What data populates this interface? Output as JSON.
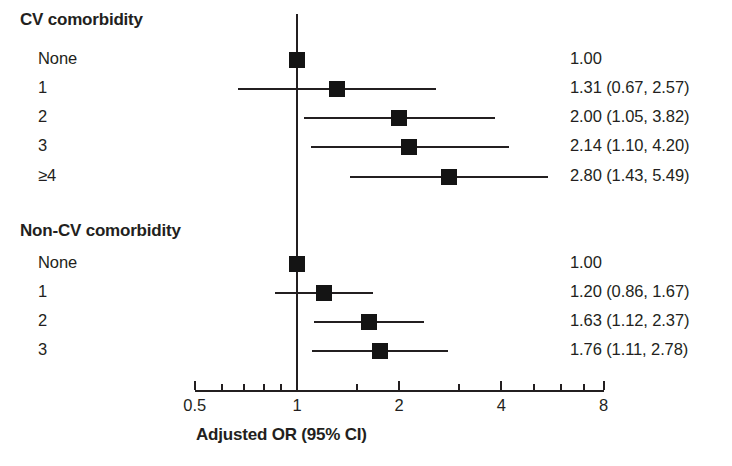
{
  "chart_data": {
    "type": "table",
    "title": "",
    "xlabel": "Adjusted OR (95% CI)",
    "ylabel": "",
    "scale": "log2",
    "xlim": [
      0.5,
      8
    ],
    "reference_line": 1.0,
    "grid": false,
    "legend": "none",
    "axis": {
      "caption": "Adjusted OR (95% CI)",
      "major_ticks": [
        {
          "value": 0.5,
          "label": "0.5"
        },
        {
          "value": 1,
          "label": "1"
        },
        {
          "value": 2,
          "label": "2"
        },
        {
          "value": 4,
          "label": "4"
        },
        {
          "value": 8,
          "label": "8"
        }
      ],
      "minor_ticks": [
        0.6,
        0.7,
        0.8,
        0.9,
        1.5,
        3,
        5,
        6,
        7
      ]
    },
    "groups": [
      {
        "header": "CV comorbidity",
        "rows": [
          {
            "label": "None",
            "or": 1.0,
            "lcl": null,
            "ucl": null,
            "text": "1.00"
          },
          {
            "label": "1",
            "or": 1.31,
            "lcl": 0.67,
            "ucl": 2.57,
            "text": "1.31 (0.67, 2.57)"
          },
          {
            "label": "2",
            "or": 2.0,
            "lcl": 1.05,
            "ucl": 3.82,
            "text": "2.00 (1.05, 3.82)"
          },
          {
            "label": "3",
            "or": 2.14,
            "lcl": 1.1,
            "ucl": 4.2,
            "text": "2.14 (1.10, 4.20)"
          },
          {
            "label": "≥4",
            "or": 2.8,
            "lcl": 1.43,
            "ucl": 5.49,
            "text": "2.80 (1.43, 5.49)"
          }
        ]
      },
      {
        "header": "Non-CV comorbidity",
        "rows": [
          {
            "label": "None",
            "or": 1.0,
            "lcl": null,
            "ucl": null,
            "text": "1.00"
          },
          {
            "label": "1",
            "or": 1.2,
            "lcl": 0.86,
            "ucl": 1.67,
            "text": "1.20 (0.86, 1.67)"
          },
          {
            "label": "2",
            "or": 1.63,
            "lcl": 1.12,
            "ucl": 2.37,
            "text": "1.63 (1.12, 2.37)"
          },
          {
            "label": "3",
            "or": 1.76,
            "lcl": 1.11,
            "ucl": 2.78,
            "text": "1.76 (1.11, 2.78)"
          }
        ]
      }
    ],
    "colors": {
      "marker": "#141414",
      "line": "#231f20",
      "text": "#231f20"
    }
  },
  "layout": {
    "label_x": 38,
    "header_x": 20,
    "stat_x": 570,
    "row_y": [
      60,
      89,
      118,
      147,
      177,
      264,
      293,
      322,
      351
    ],
    "header_y": [
      22,
      233
    ],
    "axis_y": 390,
    "x_of_1": 297,
    "px_per_doubling": 102.2,
    "marker_size": 16,
    "refline_top": 14,
    "caption_x": 196,
    "caption_y": 437
  }
}
